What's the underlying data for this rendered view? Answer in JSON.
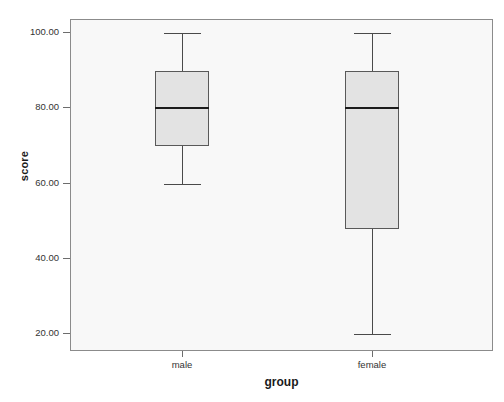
{
  "chart_data": {
    "type": "box",
    "title": "",
    "xlabel": "group",
    "ylabel": "score",
    "categories": [
      "male",
      "female"
    ],
    "ylim": [
      14,
      104
    ],
    "yticks": [
      20,
      40,
      60,
      80,
      100
    ],
    "ytick_labels": [
      "20.00",
      "40.00",
      "60.00",
      "80.00",
      "100.00"
    ],
    "grid": false,
    "legend": "none",
    "series": [
      {
        "name": "male",
        "whisker_low": 60,
        "q1": 70,
        "median": 80,
        "q3": 90,
        "whisker_high": 100,
        "outliers": []
      },
      {
        "name": "female",
        "whisker_low": 20,
        "q1": 48,
        "median": 80,
        "q3": 90,
        "whisker_high": 100,
        "outliers": []
      }
    ],
    "colors": {
      "box_fill": "#e3e3e3",
      "box_border": "#595959",
      "median_line": "#1c1c1c",
      "whisker": "#4a4a4a",
      "plot_background": "#f8f8f8",
      "frame_border": "#8b8b8b",
      "text": "#333333"
    }
  }
}
